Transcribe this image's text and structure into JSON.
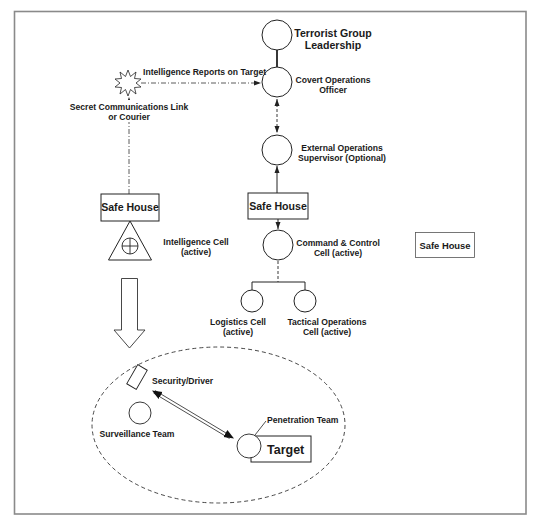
{
  "diagram": {
    "nodes": {
      "leadership": {
        "line1": "Terrorist Group",
        "line2": "Leadership"
      },
      "covert_officer": {
        "line1": "Covert Operations",
        "line2": "Officer"
      },
      "ext_supervisor": {
        "line1": "External Operations",
        "line2": "Supervisor (Optional)"
      },
      "safe_house_center": {
        "label": "Safe House"
      },
      "command_control": {
        "line1": "Command & Control",
        "line2": "Cell (active)"
      },
      "safe_house_right": {
        "label": "Safe House"
      },
      "logistics": {
        "line1": "Logistics Cell",
        "line2": "(active)"
      },
      "tactical": {
        "line1": "Tactical Operations",
        "line2": "Cell (active)"
      },
      "safe_house_left": {
        "label": "Safe House"
      },
      "intel_cell": {
        "line1": "Intelligence Cell",
        "line2": "(active)"
      },
      "security_driver": {
        "label": "Security/Driver"
      },
      "surveillance": {
        "label": "Surveillance Team"
      },
      "penetration": {
        "label": "Penetration Team"
      },
      "target": {
        "label": "Target"
      }
    },
    "edges": {
      "intel_reports": {
        "label": "Intelligence Reports on Target"
      },
      "secret_comms": {
        "line1": "Secret Communications Link",
        "line2": "or Courier"
      }
    }
  }
}
